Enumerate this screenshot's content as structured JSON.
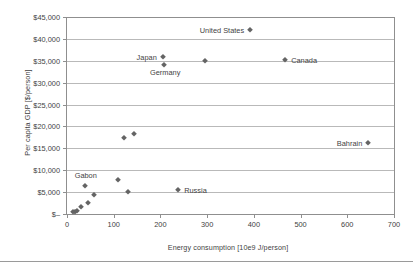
{
  "chart_data": {
    "type": "scatter",
    "title": "",
    "xlabel": "Energy consumption [10e9 J/person]",
    "ylabel": "Per capita GDP [$/person]",
    "xlim": [
      0,
      700
    ],
    "ylim": [
      0,
      45000
    ],
    "grid": true,
    "legend": "none",
    "xticks": [
      "0",
      "100",
      "200",
      "300",
      "400",
      "500",
      "600",
      "700"
    ],
    "xtick_values": [
      0,
      100,
      200,
      300,
      400,
      500,
      600,
      700
    ],
    "yticks": [
      "$–",
      "$5,000",
      "$10,000",
      "$15,000",
      "$20,000",
      "$25,000",
      "$30,000",
      "$35,000",
      "$40,000",
      "$45,000"
    ],
    "ytick_values": [
      0,
      5000,
      10000,
      15000,
      20000,
      25000,
      30000,
      35000,
      40000,
      45000
    ],
    "points": [
      {
        "x": 13,
        "y": 400,
        "label": ""
      },
      {
        "x": 17,
        "y": 500,
        "label": ""
      },
      {
        "x": 21,
        "y": 600,
        "label": ""
      },
      {
        "x": 31,
        "y": 1700,
        "label": ""
      },
      {
        "x": 38,
        "y": 6300,
        "label": "Gabon",
        "label_pos": "above-left"
      },
      {
        "x": 46,
        "y": 2500,
        "label": ""
      },
      {
        "x": 57,
        "y": 4400,
        "label": ""
      },
      {
        "x": 110,
        "y": 7800,
        "label": ""
      },
      {
        "x": 123,
        "y": 17400,
        "label": ""
      },
      {
        "x": 130,
        "y": 5000,
        "label": ""
      },
      {
        "x": 143,
        "y": 18300,
        "label": ""
      },
      {
        "x": 238,
        "y": 5400,
        "label": "Russia",
        "label_pos": "right"
      },
      {
        "x": 205,
        "y": 35900,
        "label": "Japan",
        "label_pos": "left"
      },
      {
        "x": 208,
        "y": 34000,
        "label": "Germany",
        "label_pos": "below-left"
      },
      {
        "x": 296,
        "y": 34900,
        "label": ""
      },
      {
        "x": 392,
        "y": 42000,
        "label": "United States",
        "label_pos": "left"
      },
      {
        "x": 467,
        "y": 35100,
        "label": "Canada",
        "label_pos": "right"
      },
      {
        "x": 645,
        "y": 16200,
        "label": "Bahrain",
        "label_pos": "left"
      }
    ],
    "annotations": [
      {
        "text": "United States",
        "x": 392,
        "y": 42000
      },
      {
        "text": "Japan",
        "x": 205,
        "y": 35900
      },
      {
        "text": "Germany",
        "x": 208,
        "y": 32400
      },
      {
        "text": "Canada",
        "x": 467,
        "y": 35100
      },
      {
        "text": "Bahrain",
        "x": 645,
        "y": 16200
      },
      {
        "text": "Gabon",
        "x": 38,
        "y": 8900
      },
      {
        "text": "Russia",
        "x": 238,
        "y": 5400
      }
    ]
  },
  "colors": {
    "marker": "#646464",
    "gridline": "#b9b9b9",
    "frame": "#8f8f8f",
    "text": "#3f3f3f",
    "background": "#ffffff"
  }
}
